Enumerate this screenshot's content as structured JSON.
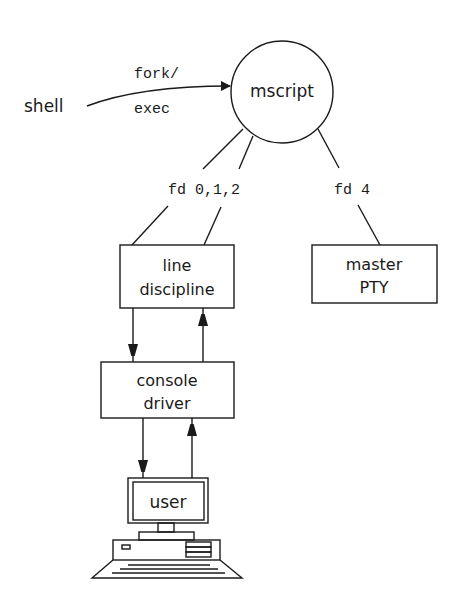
{
  "diagram": {
    "nodes": {
      "shell": {
        "label": "shell"
      },
      "mscript": {
        "label": "mscript",
        "shape": "circle"
      },
      "line_discipline": {
        "line1": "line",
        "line2": "discipline"
      },
      "master_pty": {
        "line1": "master",
        "line2": "PTY"
      },
      "console_driver": {
        "line1": "console",
        "line2": "driver"
      },
      "user": {
        "label": "user",
        "shape": "computer"
      }
    },
    "edges": {
      "shell_to_mscript": {
        "label_top": "fork/",
        "label_bottom": "exec"
      },
      "mscript_fds_012": {
        "label": "fd 0,1,2"
      },
      "mscript_fd4": {
        "label": "fd 4"
      }
    },
    "colors": {
      "ink": "#1a1a1a",
      "background": "#ffffff"
    }
  }
}
